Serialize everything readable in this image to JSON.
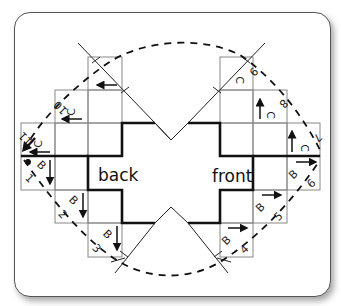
{
  "diagram": {
    "labels": {
      "back": "back",
      "front": "front"
    },
    "cells": [
      {
        "id": "1",
        "number": "1",
        "letter": "B",
        "arrow": "down",
        "dot": true
      },
      {
        "id": "2",
        "number": "2",
        "letter": "B",
        "arrow": "down"
      },
      {
        "id": "3",
        "number": "3",
        "letter": "B",
        "arrow": "down"
      },
      {
        "id": "4",
        "number": "4",
        "letter": "B",
        "arrow": "right"
      },
      {
        "id": "5",
        "number": "5",
        "letter": "B",
        "arrow": "right"
      },
      {
        "id": "6",
        "number": "6",
        "letter": "B",
        "arrow": "right"
      },
      {
        "id": "7",
        "number": "7",
        "letter": "C",
        "arrow": "up"
      },
      {
        "id": "8",
        "number": "8",
        "letter": "C",
        "arrow": "up"
      },
      {
        "id": "9",
        "number": "9",
        "letter": "C",
        "arrow": "up"
      },
      {
        "id": "10",
        "number": "10",
        "letter": "C",
        "arrow": "left"
      },
      {
        "id": "11",
        "number": "11",
        "letter": "C",
        "arrow": "left",
        "bold_arrow": "down-left"
      }
    ],
    "icons": [
      "dot-marker-icon",
      "arrow-icon",
      "fold-line-icon"
    ]
  }
}
